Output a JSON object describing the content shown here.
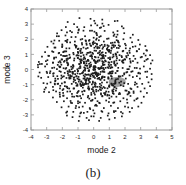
{
  "figure": {
    "caption": "(b)",
    "background_color": "#ffffff"
  },
  "chart_data": {
    "type": "scatter",
    "title": "",
    "xlabel": "mode 2",
    "ylabel": "mode 3",
    "xlim": [
      -4,
      5
    ],
    "ylim": [
      -4,
      4
    ],
    "xticks": [
      -4,
      -3,
      -2,
      -1,
      0,
      1,
      2,
      3,
      4,
      5
    ],
    "xtick_labels": [
      "-4",
      "-3",
      "-2",
      "-1",
      "0",
      "1",
      "2",
      "3",
      "4",
      "5"
    ],
    "yticks": [
      -4,
      -3,
      -2,
      -1,
      0,
      1,
      2,
      3,
      4
    ],
    "ytick_labels": [
      "-4",
      "-3",
      "-2",
      "-1",
      "0",
      "1",
      "2",
      "3",
      "4"
    ],
    "grid": false,
    "legend": null,
    "marker": {
      "shape": "square",
      "size_px": 1.7,
      "color": "#1c1c1c"
    },
    "highlight_region": {
      "label": "gray-cluster",
      "color": "#8f8f8f",
      "center": [
        1.5,
        -0.82
      ],
      "radius_x": 0.55,
      "radius_y": 0.33
    },
    "series": [
      {
        "name": "samples",
        "n_points": 900,
        "distribution": "gaussian",
        "center": [
          -0.05,
          0.0
        ],
        "std": [
          1.35,
          1.3
        ],
        "color": "#1c1c1c",
        "points": [
          [
            -0.2,
            3.35
          ],
          [
            0.55,
            3.3
          ],
          [
            1.35,
            3.2
          ],
          [
            -1.25,
            3.0
          ],
          [
            0.1,
            3.05
          ],
          [
            0.95,
            2.95
          ],
          [
            1.8,
            2.85
          ],
          [
            -0.6,
            2.8
          ],
          [
            0.4,
            2.75
          ],
          [
            -2.05,
            2.6
          ],
          [
            -1.5,
            2.55
          ],
          [
            -0.95,
            2.65
          ],
          [
            0.05,
            2.5
          ],
          [
            0.7,
            2.55
          ],
          [
            1.25,
            2.45
          ],
          [
            1.95,
            2.4
          ],
          [
            2.5,
            2.3
          ],
          [
            -2.35,
            2.2
          ],
          [
            -1.8,
            2.25
          ],
          [
            -1.15,
            2.15
          ],
          [
            -0.55,
            2.2
          ],
          [
            0.0,
            2.1
          ],
          [
            0.45,
            2.2
          ],
          [
            0.95,
            2.05
          ],
          [
            1.45,
            2.15
          ],
          [
            1.9,
            2.0
          ],
          [
            2.35,
            2.1
          ],
          [
            2.85,
            1.95
          ],
          [
            -2.7,
            1.85
          ],
          [
            -2.2,
            1.9
          ],
          [
            -1.7,
            1.8
          ],
          [
            -1.2,
            1.85
          ],
          [
            -0.75,
            1.75
          ],
          [
            -0.3,
            1.9
          ],
          [
            0.2,
            1.7
          ],
          [
            0.65,
            1.85
          ],
          [
            1.1,
            1.75
          ],
          [
            1.55,
            1.9
          ],
          [
            2.0,
            1.7
          ],
          [
            2.45,
            1.8
          ],
          [
            2.95,
            1.65
          ],
          [
            3.3,
            1.55
          ],
          [
            -2.95,
            1.5
          ],
          [
            -2.5,
            1.45
          ],
          [
            -2.0,
            1.55
          ],
          [
            -1.55,
            1.4
          ],
          [
            -1.1,
            1.55
          ],
          [
            -0.65,
            1.45
          ],
          [
            -0.2,
            1.6
          ],
          [
            0.25,
            1.4
          ],
          [
            0.7,
            1.55
          ],
          [
            1.15,
            1.45
          ],
          [
            1.6,
            1.6
          ],
          [
            2.05,
            1.4
          ],
          [
            2.5,
            1.5
          ],
          [
            2.9,
            1.35
          ],
          [
            3.4,
            1.25
          ],
          [
            -3.1,
            1.15
          ],
          [
            -2.65,
            1.2
          ],
          [
            -2.2,
            1.1
          ],
          [
            -1.75,
            1.2
          ],
          [
            -1.3,
            1.1
          ],
          [
            -0.85,
            1.25
          ],
          [
            -0.4,
            1.1
          ],
          [
            0.05,
            1.25
          ],
          [
            0.5,
            1.1
          ],
          [
            0.95,
            1.2
          ],
          [
            1.4,
            1.05
          ],
          [
            1.85,
            1.2
          ],
          [
            2.3,
            1.1
          ],
          [
            2.75,
            1.2
          ],
          [
            3.2,
            1.05
          ],
          [
            3.6,
            0.95
          ],
          [
            -3.3,
            0.85
          ],
          [
            -2.85,
            0.9
          ],
          [
            -2.4,
            0.8
          ],
          [
            -1.95,
            0.9
          ],
          [
            -1.5,
            0.8
          ],
          [
            -1.05,
            0.95
          ],
          [
            -0.6,
            0.8
          ],
          [
            -0.15,
            0.95
          ],
          [
            0.3,
            0.8
          ],
          [
            0.75,
            0.9
          ],
          [
            1.2,
            0.8
          ],
          [
            1.65,
            0.95
          ],
          [
            2.1,
            0.8
          ],
          [
            2.55,
            0.9
          ],
          [
            3.0,
            0.8
          ],
          [
            3.45,
            0.7
          ],
          [
            3.75,
            0.6
          ],
          [
            -3.5,
            0.5
          ],
          [
            -3.05,
            0.55
          ],
          [
            -2.6,
            0.45
          ],
          [
            -2.15,
            0.55
          ],
          [
            -1.7,
            0.45
          ],
          [
            -1.25,
            0.6
          ],
          [
            -0.8,
            0.45
          ],
          [
            -0.35,
            0.6
          ],
          [
            0.1,
            0.45
          ],
          [
            0.55,
            0.55
          ],
          [
            1.0,
            0.45
          ],
          [
            1.45,
            0.6
          ],
          [
            1.9,
            0.45
          ],
          [
            2.35,
            0.55
          ],
          [
            2.8,
            0.45
          ],
          [
            3.25,
            0.55
          ],
          [
            3.65,
            0.4
          ],
          [
            -3.55,
            0.15
          ],
          [
            -3.1,
            0.2
          ],
          [
            -2.65,
            0.1
          ],
          [
            -2.2,
            0.2
          ],
          [
            -1.75,
            0.1
          ],
          [
            -1.3,
            0.25
          ],
          [
            -0.85,
            0.1
          ],
          [
            -0.4,
            0.25
          ],
          [
            0.05,
            0.1
          ],
          [
            0.5,
            0.2
          ],
          [
            0.95,
            0.1
          ],
          [
            1.4,
            0.25
          ],
          [
            1.85,
            0.1
          ],
          [
            2.3,
            0.2
          ],
          [
            2.75,
            0.1
          ],
          [
            3.2,
            0.2
          ],
          [
            3.6,
            0.05
          ],
          [
            -3.45,
            -0.2
          ],
          [
            -3.0,
            -0.15
          ],
          [
            -2.55,
            -0.25
          ],
          [
            -2.1,
            -0.15
          ],
          [
            -1.65,
            -0.25
          ],
          [
            -1.2,
            -0.1
          ],
          [
            -0.75,
            -0.25
          ],
          [
            -0.3,
            -0.1
          ],
          [
            0.15,
            -0.25
          ],
          [
            0.6,
            -0.15
          ],
          [
            1.05,
            -0.25
          ],
          [
            1.5,
            -0.1
          ],
          [
            1.95,
            -0.25
          ],
          [
            2.4,
            -0.15
          ],
          [
            2.85,
            -0.25
          ],
          [
            3.3,
            -0.15
          ],
          [
            3.7,
            -0.3
          ],
          [
            -3.35,
            -0.55
          ],
          [
            -2.9,
            -0.5
          ],
          [
            -2.45,
            -0.6
          ],
          [
            -2.0,
            -0.5
          ],
          [
            -1.55,
            -0.6
          ],
          [
            -1.1,
            -0.45
          ],
          [
            -0.65,
            -0.6
          ],
          [
            -0.2,
            -0.45
          ],
          [
            0.25,
            -0.6
          ],
          [
            0.7,
            -0.5
          ],
          [
            1.15,
            -0.6
          ],
          [
            1.6,
            -0.45
          ],
          [
            2.05,
            -0.6
          ],
          [
            2.5,
            -0.5
          ],
          [
            2.95,
            -0.6
          ],
          [
            3.4,
            -0.5
          ],
          [
            3.7,
            -0.65
          ],
          [
            -3.2,
            -0.9
          ],
          [
            -2.75,
            -0.85
          ],
          [
            -2.3,
            -0.95
          ],
          [
            -1.85,
            -0.85
          ],
          [
            -1.4,
            -0.95
          ],
          [
            -0.95,
            -0.8
          ],
          [
            -0.5,
            -0.95
          ],
          [
            -0.05,
            -0.8
          ],
          [
            0.4,
            -0.95
          ],
          [
            0.85,
            -0.85
          ],
          [
            1.3,
            -0.95
          ],
          [
            1.75,
            -0.8
          ],
          [
            2.2,
            -0.95
          ],
          [
            2.65,
            -0.85
          ],
          [
            3.1,
            -0.95
          ],
          [
            3.5,
            -0.85
          ],
          [
            -3.05,
            -1.2
          ],
          [
            -2.6,
            -1.15
          ],
          [
            -2.15,
            -1.25
          ],
          [
            -1.7,
            -1.15
          ],
          [
            -1.25,
            -1.25
          ],
          [
            -0.8,
            -1.1
          ],
          [
            -0.35,
            -1.25
          ],
          [
            0.1,
            -1.1
          ],
          [
            0.55,
            -1.25
          ],
          [
            1.0,
            -1.15
          ],
          [
            1.45,
            -1.25
          ],
          [
            1.9,
            -1.1
          ],
          [
            2.35,
            -1.25
          ],
          [
            2.8,
            -1.15
          ],
          [
            3.25,
            -1.25
          ],
          [
            3.6,
            -1.1
          ],
          [
            -2.85,
            -1.5
          ],
          [
            -2.4,
            -1.45
          ],
          [
            -1.95,
            -1.55
          ],
          [
            -1.5,
            -1.45
          ],
          [
            -1.05,
            -1.55
          ],
          [
            -0.6,
            -1.4
          ],
          [
            -0.15,
            -1.55
          ],
          [
            0.3,
            -1.4
          ],
          [
            0.75,
            -1.55
          ],
          [
            1.2,
            -1.45
          ],
          [
            1.65,
            -1.55
          ],
          [
            2.1,
            -1.4
          ],
          [
            2.55,
            -1.55
          ],
          [
            3.0,
            -1.45
          ],
          [
            3.4,
            -1.55
          ],
          [
            -2.6,
            -1.85
          ],
          [
            -2.15,
            -1.8
          ],
          [
            -1.7,
            -1.9
          ],
          [
            -1.25,
            -1.8
          ],
          [
            -0.8,
            -1.9
          ],
          [
            -0.35,
            -1.75
          ],
          [
            0.1,
            -1.9
          ],
          [
            0.55,
            -1.75
          ],
          [
            1.0,
            -1.9
          ],
          [
            1.45,
            -1.8
          ],
          [
            1.9,
            -1.9
          ],
          [
            2.35,
            -1.75
          ],
          [
            2.8,
            -1.9
          ],
          [
            3.2,
            -1.8
          ],
          [
            -2.35,
            -2.15
          ],
          [
            -1.9,
            -2.1
          ],
          [
            -1.45,
            -2.2
          ],
          [
            -1.0,
            -2.1
          ],
          [
            -0.55,
            -2.2
          ],
          [
            -0.1,
            -2.05
          ],
          [
            0.35,
            -2.2
          ],
          [
            0.8,
            -2.05
          ],
          [
            1.25,
            -2.2
          ],
          [
            1.7,
            -2.1
          ],
          [
            2.15,
            -2.2
          ],
          [
            2.6,
            -2.05
          ],
          [
            3.05,
            -2.2
          ],
          [
            -2.05,
            -2.5
          ],
          [
            -1.6,
            -2.45
          ],
          [
            -1.15,
            -2.55
          ],
          [
            -0.7,
            -2.45
          ],
          [
            -0.25,
            -2.55
          ],
          [
            0.2,
            -2.4
          ],
          [
            0.65,
            -2.55
          ],
          [
            1.1,
            -2.4
          ],
          [
            1.55,
            -2.55
          ],
          [
            2.0,
            -2.45
          ],
          [
            2.45,
            -2.55
          ],
          [
            2.85,
            -2.45
          ],
          [
            -1.75,
            -2.85
          ],
          [
            -1.3,
            -2.8
          ],
          [
            -0.85,
            -2.9
          ],
          [
            -0.4,
            -2.8
          ],
          [
            0.05,
            -2.9
          ],
          [
            0.5,
            -2.75
          ],
          [
            0.95,
            -2.9
          ],
          [
            1.4,
            -2.75
          ],
          [
            1.85,
            -2.9
          ],
          [
            2.3,
            -2.8
          ],
          [
            -1.35,
            -3.15
          ],
          [
            -0.9,
            -3.1
          ],
          [
            -0.45,
            -3.2
          ],
          [
            0.0,
            -3.1
          ],
          [
            0.45,
            -3.2
          ],
          [
            0.9,
            -3.05
          ],
          [
            1.35,
            -3.2
          ],
          [
            1.8,
            -3.1
          ],
          [
            -0.95,
            -3.4
          ],
          [
            -0.3,
            -3.35
          ],
          [
            0.35,
            -3.4
          ],
          [
            1.0,
            -3.3
          ]
        ]
      }
    ]
  }
}
